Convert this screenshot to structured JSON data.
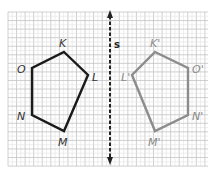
{
  "diagram": {
    "type": "reflection",
    "grid": {
      "left": 8,
      "top": 12,
      "right": 208,
      "bottom": 166,
      "minor_spacing": 4.28,
      "major_every": 2,
      "minor_color": "#e3e3e3",
      "major_color": "#c4c4c4"
    },
    "mirror_line": {
      "label": "s",
      "x": 110,
      "y1": 10,
      "y2": 165,
      "color": "#222222",
      "style": "dashed",
      "arrows": "both"
    },
    "original": {
      "color": "#1a1a1a",
      "vertices": [
        {
          "name": "K",
          "x": 64,
          "y": 52
        },
        {
          "name": "L",
          "x": 88,
          "y": 75
        },
        {
          "name": "M",
          "x": 64,
          "y": 131
        },
        {
          "name": "N",
          "x": 32,
          "y": 115
        },
        {
          "name": "O",
          "x": 32,
          "y": 68
        }
      ],
      "labels": [
        {
          "text": "K",
          "x": 59,
          "y": 47
        },
        {
          "text": "L",
          "x": 92,
          "y": 81
        },
        {
          "text": "M",
          "x": 58,
          "y": 146
        },
        {
          "text": "N",
          "x": 17,
          "y": 120
        },
        {
          "text": "O",
          "x": 17,
          "y": 73
        }
      ]
    },
    "image": {
      "color": "#8c8c8c",
      "vertices": [
        {
          "name": "K'",
          "x": 155,
          "y": 52
        },
        {
          "name": "O'",
          "x": 188,
          "y": 68
        },
        {
          "name": "N'",
          "x": 188,
          "y": 115
        },
        {
          "name": "M'",
          "x": 155,
          "y": 131
        },
        {
          "name": "L'",
          "x": 132,
          "y": 75
        }
      ],
      "labels": [
        {
          "text": "K'",
          "x": 150,
          "y": 47
        },
        {
          "text": "O'",
          "x": 192,
          "y": 73
        },
        {
          "text": "N'",
          "x": 192,
          "y": 120
        },
        {
          "text": "M'",
          "x": 148,
          "y": 146
        },
        {
          "text": "L'",
          "x": 121,
          "y": 81
        }
      ]
    }
  }
}
